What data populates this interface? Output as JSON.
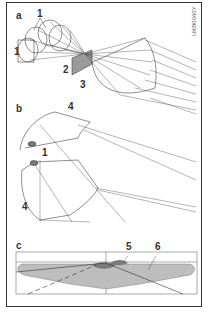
{
  "figure": {
    "code": "UKB0660Y",
    "panels": [
      {
        "id": "a",
        "label": "a",
        "callouts": [
          "1",
          "2",
          "3"
        ]
      },
      {
        "id": "b",
        "label": "b",
        "callouts": [
          "4",
          "1",
          "4"
        ]
      },
      {
        "id": "c",
        "label": "c",
        "callouts": [
          "5",
          "6"
        ]
      }
    ]
  },
  "labels": {
    "panel_a": "a",
    "panel_b": "b",
    "panel_c": "c",
    "a_1_top": "1",
    "a_1_left": "1",
    "a_2": "2",
    "a_3": "3",
    "b_4_top": "4",
    "b_1": "1",
    "b_4_bottom": "4",
    "c_5": "5",
    "c_6": "6",
    "code": "UKB0660Y"
  },
  "colors": {
    "line": "#444444",
    "shade_light": "#bdbdbd",
    "shade_dark": "#7a7a7a",
    "frame": "#333333"
  }
}
